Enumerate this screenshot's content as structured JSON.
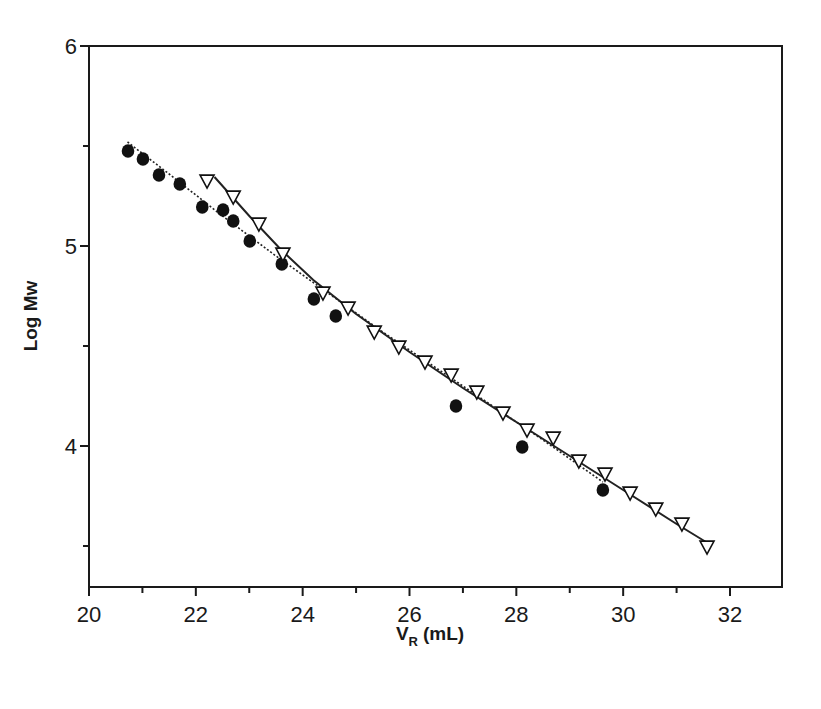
{
  "chart_data": {
    "type": "scatter",
    "title": "",
    "xlabel": "V_R (mL)",
    "xlabel_main": "V",
    "xlabel_sub": "R",
    "xlabel_unit": "(mL)",
    "ylabel": "Log Mw",
    "xlim": [
      20,
      33
    ],
    "ylim": [
      3.3,
      6
    ],
    "x_ticks": [
      20,
      22,
      24,
      26,
      28,
      30,
      32
    ],
    "x_minor_ticks": [
      21,
      23,
      25,
      27,
      29,
      31,
      33
    ],
    "y_ticks": [
      4,
      5,
      6
    ],
    "y_minor_ticks": [
      3.5,
      4.5,
      5.5
    ],
    "grid": false,
    "legend": null,
    "series": [
      {
        "name": "filled circles",
        "marker": "circle-filled",
        "color": "#111111",
        "x": [
          20.73,
          21.01,
          21.31,
          21.7,
          22.12,
          22.51,
          22.7,
          23.01,
          23.61,
          24.21,
          24.62,
          26.87,
          28.11,
          29.62
        ],
        "y": [
          5.475,
          5.435,
          5.355,
          5.31,
          5.195,
          5.18,
          5.125,
          5.025,
          4.91,
          4.735,
          4.65,
          4.2,
          3.995,
          3.78
        ],
        "fit_line": {
          "style": "dotted",
          "x": [
            20.72,
            21.5,
            22.5,
            23.5,
            24.5,
            25.5,
            26.5,
            27.5,
            28.5,
            29.62
          ],
          "y": [
            5.52,
            5.36,
            5.15,
            4.95,
            4.76,
            4.57,
            4.39,
            4.21,
            4.03,
            3.82
          ]
        }
      },
      {
        "name": "open inverted triangles",
        "marker": "triangle-down-open",
        "color": "#111111",
        "x": [
          22.21,
          22.7,
          23.18,
          23.63,
          24.38,
          24.85,
          25.34,
          25.8,
          26.29,
          26.78,
          27.26,
          27.75,
          28.2,
          28.69,
          29.17,
          29.66,
          30.13,
          30.61,
          31.1,
          31.57
        ],
        "y": [
          5.325,
          5.245,
          5.11,
          4.96,
          4.765,
          4.69,
          4.57,
          4.495,
          4.42,
          4.355,
          4.27,
          4.165,
          4.08,
          4.04,
          3.925,
          3.86,
          3.765,
          3.685,
          3.61,
          3.495
        ],
        "fit_line": {
          "style": "solid",
          "x": [
            22.35,
            23.0,
            23.6,
            24.2,
            25.0,
            26.0,
            27.0,
            28.0,
            29.0,
            30.0,
            31.0,
            31.55
          ],
          "y": [
            5.345,
            5.15,
            4.98,
            4.83,
            4.66,
            4.47,
            4.29,
            4.12,
            3.95,
            3.78,
            3.61,
            3.52
          ]
        }
      }
    ]
  },
  "layout": {
    "plot_left": 89,
    "plot_right": 782,
    "plot_top": 46,
    "plot_bottom": 587
  }
}
